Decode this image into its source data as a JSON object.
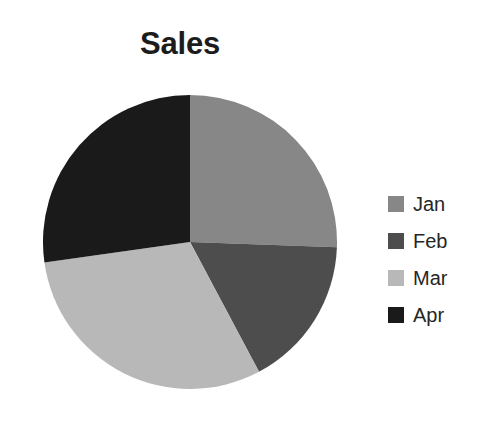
{
  "chart_data": {
    "type": "pie",
    "title": "Sales",
    "categories": [
      "Jan",
      "Feb",
      "Mar",
      "Apr"
    ],
    "values": [
      25.5,
      16.7,
      30.5,
      27.3
    ],
    "units": "percent",
    "colors": [
      "#878787",
      "#4d4d4d",
      "#b8b8b8",
      "#1a1a1a"
    ],
    "start_angle_deg": 0,
    "direction": "clockwise",
    "slice_angles_deg": [
      92,
      60,
      110,
      98
    ],
    "slice_boundaries_deg": [
      0,
      92,
      152,
      262,
      360
    ],
    "legend_position": "right",
    "grid": false,
    "xlabel": "",
    "ylabel": ""
  },
  "title": {
    "text": "Sales"
  },
  "legend": {
    "entries": [
      {
        "label": "Jan",
        "color": "#878787"
      },
      {
        "label": "Feb",
        "color": "#4d4d4d"
      },
      {
        "label": "Mar",
        "color": "#b8b8b8"
      },
      {
        "label": "Apr",
        "color": "#1a1a1a"
      }
    ]
  }
}
